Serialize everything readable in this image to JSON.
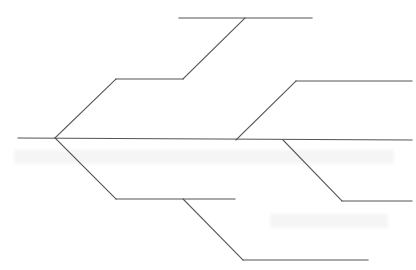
{
  "diagram": {
    "type": "tree-skeleton",
    "line_color": "#555555",
    "background": "#ffffff",
    "root": {
      "x": 55,
      "y": 138
    },
    "spine": {
      "x1": 18,
      "y1": 138,
      "x2": 412,
      "y2": 140
    },
    "segments": [
      {
        "id": "upper-diag",
        "x1": 55,
        "y1": 138,
        "x2": 116,
        "y2": 79
      },
      {
        "id": "upper-horizontal",
        "x1": 116,
        "y1": 79,
        "x2": 183,
        "y2": 79
      },
      {
        "id": "top-diag",
        "x1": 183,
        "y1": 79,
        "x2": 245,
        "y2": 18
      },
      {
        "id": "top-horizontal",
        "x1": 179,
        "y1": 18,
        "x2": 312,
        "y2": 18
      },
      {
        "id": "right-upper-diag",
        "x1": 236,
        "y1": 140,
        "x2": 296,
        "y2": 81
      },
      {
        "id": "right-upper-horizontal",
        "x1": 296,
        "y1": 81,
        "x2": 412,
        "y2": 81
      },
      {
        "id": "right-lower-diag",
        "x1": 283,
        "y1": 140,
        "x2": 342,
        "y2": 201
      },
      {
        "id": "right-lower-horizontal",
        "x1": 342,
        "y1": 201,
        "x2": 412,
        "y2": 201
      },
      {
        "id": "lower-diag",
        "x1": 55,
        "y1": 138,
        "x2": 116,
        "y2": 199
      },
      {
        "id": "lower-horizontal",
        "x1": 116,
        "y1": 199,
        "x2": 235,
        "y2": 199
      },
      {
        "id": "bottom-diag",
        "x1": 183,
        "y1": 199,
        "x2": 243,
        "y2": 260
      },
      {
        "id": "bottom-horizontal",
        "x1": 243,
        "y1": 260,
        "x2": 368,
        "y2": 260
      }
    ],
    "labels": []
  },
  "caption": {
    "text": ""
  }
}
